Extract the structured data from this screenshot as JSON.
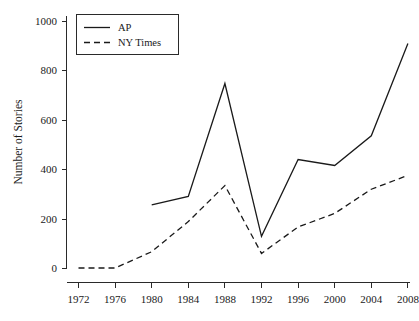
{
  "chart_data": {
    "type": "line",
    "title": "",
    "subtitle": "",
    "xlabel": "",
    "ylabel": "Number of Stories",
    "x": [
      1972,
      1976,
      1980,
      1984,
      1988,
      1992,
      1996,
      2000,
      2004,
      2008
    ],
    "xticklabels": [
      "1972",
      "1976",
      "1980",
      "1984",
      "1988",
      "1992",
      "1996",
      "2000",
      "2004",
      "2008"
    ],
    "yticklabels": [
      "0",
      "200",
      "400",
      "600",
      "800",
      "1000"
    ],
    "yticks": [
      0,
      200,
      400,
      600,
      800,
      1000
    ],
    "ylim": [
      0,
      1000
    ],
    "xlim": [
      1972,
      2008
    ],
    "grid": false,
    "legend_position": "top-left",
    "series": [
      {
        "name": "AP",
        "style": "solid",
        "color": "#1a1a1a",
        "x": [
          1980,
          1984,
          1988,
          1992,
          1996,
          2000,
          2004,
          2008
        ],
        "values": [
          258,
          292,
          749,
          130,
          441,
          417,
          537,
          911
        ]
      },
      {
        "name": "NY Times",
        "style": "dashed",
        "color": "#1a1a1a",
        "x": [
          1972,
          1976,
          1980,
          1984,
          1988,
          1992,
          1996,
          2000,
          2004,
          2008
        ],
        "values": [
          2,
          2,
          68,
          190,
          336,
          61,
          168,
          223,
          321,
          377
        ]
      }
    ],
    "legend_entries": [
      {
        "label": "AP",
        "style": "solid"
      },
      {
        "label": "NY Times",
        "style": "dashed"
      }
    ]
  }
}
